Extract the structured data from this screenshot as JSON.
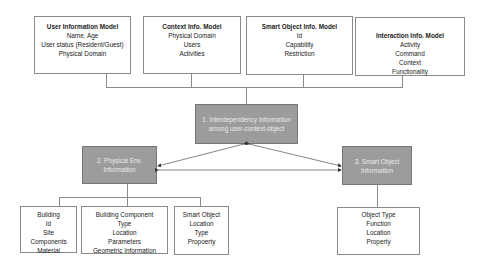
{
  "top_models": [
    {
      "title": "User Information Model",
      "items": [
        "Name. Age",
        "User status (Resident/Guest)",
        "Physical Domain"
      ]
    },
    {
      "title": "Context Info. Model",
      "items": [
        "Physical Domain",
        "Users",
        "Activities"
      ]
    },
    {
      "title": "Smart Object Info. Model",
      "items": [
        "Id",
        "Capability",
        "Restriction"
      ]
    },
    {
      "title": "Interaction Info. Model",
      "items": [
        "Activity",
        "Command",
        "Context",
        "Functionality"
      ]
    }
  ],
  "central_nodes": {
    "interdependency": "1. Interdependency Information among user-context-object",
    "physical_env": "2. Physical Env. Information",
    "smart_object": "3. Smart Object Information"
  },
  "physical_env_children": [
    {
      "items": [
        "Building",
        "Id",
        "Site",
        "Components",
        "Material"
      ]
    },
    {
      "items": [
        "Building Component",
        "Type",
        "Location",
        "Parameters",
        "Geometric Information"
      ]
    },
    {
      "items": [
        "Smart Object",
        "Location",
        "Type",
        "Propoerty"
      ]
    }
  ],
  "smart_object_children": [
    {
      "items": [
        "Object Type",
        "Function",
        "Location",
        "Property"
      ]
    }
  ],
  "colors": {
    "node_fill": "#9c9c9c",
    "border": "#8a8a8a",
    "background": "#ffffff"
  }
}
